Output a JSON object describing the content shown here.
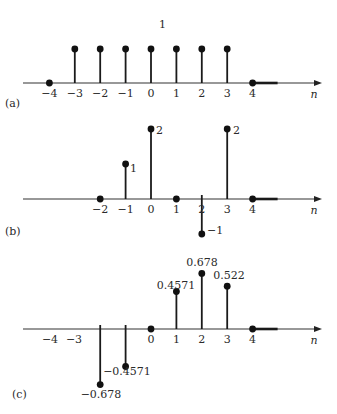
{
  "colors": {
    "ink": "#111111",
    "axis": "#333333",
    "background": "#ffffff"
  },
  "layout": {
    "x0": 151,
    "dx": 25.4,
    "axis_x_start": 23,
    "axis_x_end": 322,
    "thick_end_offset": 25
  },
  "chart_data": [
    {
      "type": "stem",
      "panel_label": "(a)",
      "xlabel": "n",
      "axis_y": 83,
      "unit_px": 34,
      "label_y": 97,
      "panel_label_pos": [
        5,
        107
      ],
      "x_ticks": [
        -4,
        -3,
        -2,
        -1,
        0,
        1,
        2,
        3,
        4
      ],
      "points": [
        {
          "n": -4,
          "value": 0
        },
        {
          "n": -3,
          "value": 1
        },
        {
          "n": -2,
          "value": 1
        },
        {
          "n": -1,
          "value": 1
        },
        {
          "n": 0,
          "value": 1
        },
        {
          "n": 1,
          "value": 1
        },
        {
          "n": 2,
          "value": 1
        },
        {
          "n": 3,
          "value": 1
        },
        {
          "n": 4,
          "value": 0
        }
      ],
      "annotations": [
        {
          "text": "1",
          "x": 159,
          "y": 28
        }
      ]
    },
    {
      "type": "stem",
      "panel_label": "(b)",
      "xlabel": "n",
      "axis_y": 199,
      "unit_px": 35,
      "label_y": 213,
      "panel_label_pos": [
        5,
        235
      ],
      "x_ticks": [
        -2,
        -1,
        0,
        1,
        2,
        3,
        4
      ],
      "points": [
        {
          "n": -2,
          "value": 0
        },
        {
          "n": -1,
          "value": 1
        },
        {
          "n": 0,
          "value": 2
        },
        {
          "n": 1,
          "value": 0
        },
        {
          "n": 2,
          "value": -1
        },
        {
          "n": 3,
          "value": 2
        },
        {
          "n": 4,
          "value": 0
        }
      ],
      "annotations": [
        {
          "text": "1",
          "x": 130,
          "y": 172
        },
        {
          "text": "2",
          "x": 156,
          "y": 134
        },
        {
          "text": "−1",
          "x": 207,
          "y": 234
        },
        {
          "text": "2",
          "x": 233,
          "y": 134
        }
      ]
    },
    {
      "type": "stem",
      "panel_label": "(c)",
      "xlabel": "n",
      "axis_y": 329,
      "unit_px": 82,
      "label_y": 343,
      "panel_label_pos": [
        12,
        398
      ],
      "x_ticks": [
        -4,
        -3,
        0,
        1,
        2,
        3,
        4
      ],
      "x_tick_label_positions": {
        "-4": 50,
        "-3": 74
      },
      "points": [
        {
          "n": -2,
          "value": -0.678
        },
        {
          "n": -1,
          "value": -0.4571
        },
        {
          "n": 0,
          "value": 0
        },
        {
          "n": 1,
          "value": 0.4571
        },
        {
          "n": 2,
          "value": 0.678
        },
        {
          "n": 3,
          "value": 0.522
        },
        {
          "n": 4,
          "value": 0
        }
      ],
      "annotations": [
        {
          "text": "0.4571",
          "x": 176,
          "y": 289,
          "anchor": "middle"
        },
        {
          "text": "0.678",
          "x": 202,
          "y": 266,
          "anchor": "middle"
        },
        {
          "text": "0.522",
          "x": 229,
          "y": 279,
          "anchor": "middle"
        },
        {
          "text": "−0.4571",
          "x": 127,
          "y": 375,
          "anchor": "middle"
        },
        {
          "text": "−0.678",
          "x": 101,
          "y": 398,
          "anchor": "middle"
        }
      ]
    }
  ]
}
